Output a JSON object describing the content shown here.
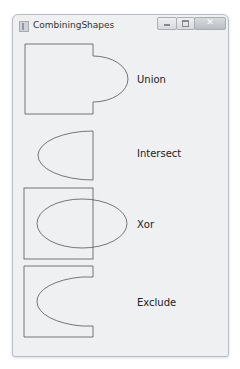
{
  "window": {
    "title": "CombiningShapes",
    "caption_buttons": [
      "minimize",
      "maximize",
      "close"
    ],
    "close_glyph": "✕"
  },
  "shapes": [
    {
      "label": "Union"
    },
    {
      "label": "Intersect"
    },
    {
      "label": "Xor"
    },
    {
      "label": "Exclude"
    }
  ],
  "colors": {
    "stroke": "#555555",
    "background": "#ffffff"
  }
}
